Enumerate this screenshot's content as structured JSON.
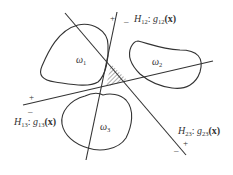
{
  "diagram": {
    "type": "decision-boundaries",
    "colors": {
      "stroke": "#333333",
      "background": "#ffffff"
    },
    "regions": [
      {
        "id": "omega1",
        "symbol": "ω",
        "sub": "1"
      },
      {
        "id": "omega2",
        "symbol": "ω",
        "sub": "2"
      },
      {
        "id": "omega3",
        "symbol": "ω",
        "sub": "3"
      }
    ],
    "hyperplanes": [
      {
        "id": "H12",
        "name": "H",
        "name_sub": "12",
        "func": "g",
        "func_sub": "12",
        "arg": "(x)",
        "sep": ": ",
        "plus": "+",
        "minus": "–"
      },
      {
        "id": "H13",
        "name": "H",
        "name_sub": "13",
        "func": "g",
        "func_sub": "13",
        "arg": "(x)",
        "sep": ": ",
        "plus": "+",
        "minus": "–"
      },
      {
        "id": "H23",
        "name": "H",
        "name_sub": "23",
        "func": "g",
        "func_sub": "23",
        "arg": "(x)",
        "sep": ": ",
        "plus": "+",
        "minus": "–"
      }
    ],
    "indeterminate_region": {
      "style": "hatched"
    }
  }
}
